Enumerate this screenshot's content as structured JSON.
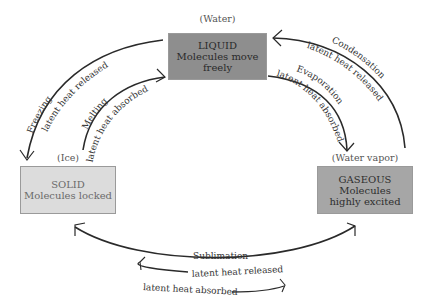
{
  "states": {
    "liquid": {
      "label": "(Water)",
      "title": "LIQUID",
      "line1": "Molecules move",
      "line2": "freely",
      "color": "#8e8e8e"
    },
    "solid": {
      "label": "(Ice)",
      "title": "SOLID",
      "line1": "Molecules locked",
      "color": "#dcdcdc"
    },
    "gaseous": {
      "label": "(Water vapor)",
      "title": "GASEOUS",
      "line1": "Molecules",
      "line2": "highly excited",
      "color": "#a6a6a6"
    }
  },
  "transitions": {
    "freezing": {
      "name": "Freezing",
      "heat": "latent heat released"
    },
    "melting": {
      "name": "Melting",
      "heat": "latent heat absorbed"
    },
    "condensation": {
      "name": "Condensation",
      "heat": "latent heat released"
    },
    "evaporation": {
      "name": "Evaporation",
      "heat": "latent heat absorbed"
    },
    "sublimation": {
      "name": "Sublimation",
      "heat_released": "latent heat released",
      "heat_absorbed": "latent heat absorbed"
    }
  }
}
